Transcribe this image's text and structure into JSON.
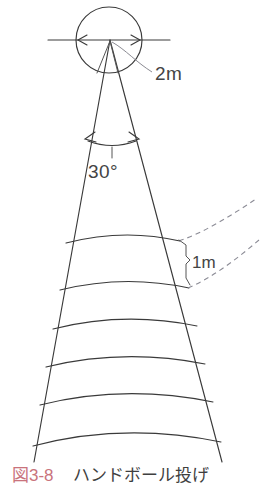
{
  "figure": {
    "kind": "technical-diagram",
    "background_color": "#ffffff",
    "line_color": "#3a3a3a",
    "dashed_color": "#8c8c96",
    "labels": {
      "circle_diameter": "2m",
      "sector_angle": "30°",
      "arc_spacing": "1m"
    },
    "geometry": {
      "apex": {
        "x": 110,
        "y": 40
      },
      "circle": {
        "cx": 109,
        "cy": 40,
        "r": 33
      },
      "baseline": {
        "x1": 48,
        "x2": 170,
        "y": 40
      },
      "angle_arc_y": 141,
      "angle_arrow_left_x": 86,
      "angle_arrow_right_x": 137,
      "arc_rows": [
        240,
        288,
        325,
        363,
        400,
        440
      ],
      "left_edge_bottom": {
        "x": 34,
        "y": 462
      },
      "right_edge_bottom": {
        "x": 222,
        "y": 462
      },
      "dashed_guides": 2
    }
  },
  "caption": {
    "number": "図3-8",
    "title": "ハンドボール投げ",
    "number_color": "#c9737c",
    "title_color": "#3f3f3f"
  }
}
